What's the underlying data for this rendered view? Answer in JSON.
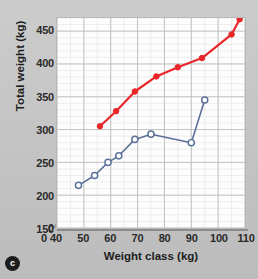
{
  "figure": {
    "label": "c"
  },
  "chart_data": {
    "type": "line",
    "title": "",
    "xlabel": "Weight class (kg)",
    "ylabel": "Total weight (kg)",
    "xlim": [
      40,
      110
    ],
    "ylim": [
      150,
      470
    ],
    "xticks": [
      0,
      40,
      50,
      60,
      70,
      80,
      90,
      100,
      110
    ],
    "yticks": [
      0,
      150,
      200,
      250,
      300,
      350,
      400,
      450
    ],
    "grid": true,
    "minor_grid": true,
    "axis_break": true,
    "legend": "none",
    "series": [
      {
        "name": "upper-series",
        "color": "#e8262a",
        "marker": "filled-circle",
        "x": [
          56,
          62,
          69,
          77,
          85,
          94,
          105,
          108
        ],
        "y": [
          305,
          328,
          358,
          381,
          395,
          409,
          445,
          468
        ]
      },
      {
        "name": "lower-series",
        "color": "#5b6f98",
        "marker": "open-circle",
        "x": [
          48,
          54,
          59,
          63,
          69,
          75,
          90,
          95
        ],
        "y": [
          215,
          230,
          250,
          260,
          285,
          293,
          280,
          345
        ]
      }
    ]
  }
}
